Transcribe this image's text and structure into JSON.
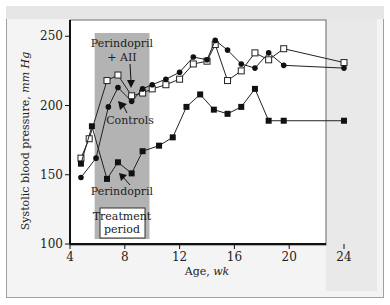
{
  "chart_data": {
    "type": "line",
    "title": "",
    "xlabel": "Age, wk",
    "ylabel": "Systolic blood pressure, mm Hg",
    "xlim": [
      4,
      25
    ],
    "ylim": [
      100,
      255
    ],
    "xticks": [
      4,
      8,
      12,
      16,
      20,
      24
    ],
    "yticks": [
      100,
      150,
      200,
      250
    ],
    "grid": false,
    "shaded_region": {
      "label": "Treatment period",
      "x_start": 5.8,
      "x_end": 9.8
    },
    "annotations": [
      {
        "text": "Perindopril + AII",
        "x": 7.8,
        "y": 240
      },
      {
        "text": "Controls",
        "x": 8.5,
        "y": 190
      },
      {
        "text": "Perindopril",
        "x": 7.6,
        "y": 141
      },
      {
        "text": "Treatment period",
        "x": 7.8,
        "y": 120
      }
    ],
    "series": [
      {
        "name": "Perindopril + AII",
        "marker": "open-square",
        "x": [
          4.8,
          5.4,
          6.7,
          7.5,
          8.5,
          9.3,
          10.0,
          11.0,
          12.0,
          13.0,
          14.0,
          14.6,
          15.5,
          16.5,
          17.5,
          18.5,
          19.6,
          24.0
        ],
        "values": [
          162,
          176,
          218,
          222,
          207,
          209,
          212,
          215,
          219,
          230,
          232,
          244,
          218,
          225,
          238,
          233,
          241,
          231
        ]
      },
      {
        "name": "Controls",
        "marker": "filled-circle",
        "x": [
          4.8,
          5.9,
          6.8,
          7.5,
          8.5,
          9.3,
          10.0,
          11.0,
          12.0,
          13.0,
          14.0,
          14.6,
          15.5,
          16.5,
          17.5,
          18.5,
          19.6,
          24.0
        ],
        "values": [
          148,
          162,
          199,
          213,
          203,
          212,
          215,
          219,
          224,
          235,
          233,
          247,
          240,
          230,
          227,
          238,
          229,
          227
        ]
      },
      {
        "name": "Perindopril",
        "marker": "filled-square",
        "x": [
          4.8,
          5.6,
          6.7,
          7.5,
          8.5,
          9.3,
          10.5,
          11.5,
          12.5,
          13.5,
          14.5,
          15.5,
          16.5,
          17.5,
          18.5,
          19.6,
          24.0
        ],
        "values": [
          158,
          185,
          147,
          159,
          151,
          167,
          171,
          177,
          199,
          208,
          197,
          194,
          199,
          212,
          189,
          189,
          189
        ]
      }
    ]
  },
  "labels": {
    "ylabel_main": "Systolic blood pressure, ",
    "ylabel_unit": "mm Hg",
    "xlabel_main": "Age, ",
    "xlabel_unit": "wk",
    "annot_perindopril_aii_1": "Perindopril",
    "annot_perindopril_aii_2": "+ AII",
    "annot_controls": "Controls",
    "annot_perindopril": "Perindopril",
    "annot_treatment_1": "Treatment",
    "annot_treatment_2": "period"
  }
}
